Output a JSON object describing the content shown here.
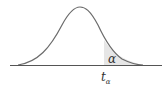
{
  "diagram": {
    "type": "t-distribution right tail",
    "tail_area_label": "α",
    "critical_value_label": "t",
    "critical_value_subscript": "α",
    "colors": {
      "curve": "#6b6b6b",
      "axis": "#555555",
      "shade": "#e6e6e6",
      "text": "#333333"
    }
  }
}
